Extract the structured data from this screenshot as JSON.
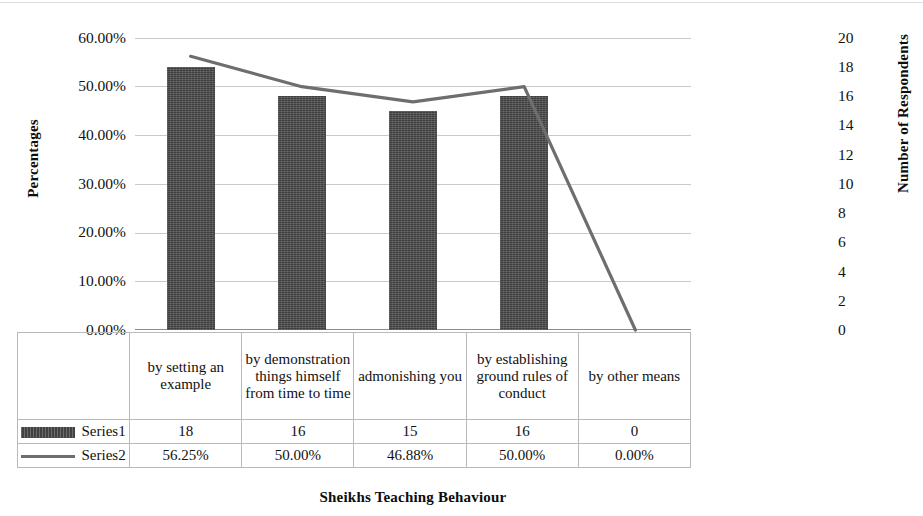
{
  "chart_data": {
    "type": "bar",
    "title": "",
    "xlabel": "Sheikhs Teaching Behaviour",
    "ylabel": "Percentages",
    "y2label": "Number of Respondents",
    "categories": [
      "by setting an example",
      "by demonstration things himself from time to time",
      "admonishing you",
      "by establishing ground rules of conduct",
      "by other means"
    ],
    "series": [
      {
        "name": "Series1",
        "type": "bar",
        "axis": "right",
        "values": [
          18,
          16,
          15,
          16,
          0
        ],
        "display_values": [
          "18",
          "16",
          "15",
          "16",
          "0"
        ],
        "color": "#4b4b4b"
      },
      {
        "name": "Series2",
        "type": "line",
        "axis": "left",
        "values": [
          56.25,
          50.0,
          46.88,
          50.0,
          0.0
        ],
        "display_values": [
          "56.25%",
          "50.00%",
          "46.88%",
          "50.00%",
          "0.00%"
        ],
        "color": "#6e6e6e"
      }
    ],
    "ylim": [
      0,
      60
    ],
    "y2lim": [
      0,
      20
    ],
    "yticks": [
      "0.00%",
      "10.00%",
      "20.00%",
      "30.00%",
      "40.00%",
      "50.00%",
      "60.00%"
    ],
    "ytick_values": [
      0,
      10,
      20,
      30,
      40,
      50,
      60
    ],
    "y2ticks": [
      "0",
      "2",
      "4",
      "6",
      "8",
      "10",
      "12",
      "14",
      "16",
      "18",
      "20"
    ],
    "y2tick_values": [
      0,
      2,
      4,
      6,
      8,
      10,
      12,
      14,
      16,
      18,
      20
    ],
    "grid": true,
    "legend_position": "data-table"
  },
  "axes": {
    "left_title": "Percentages",
    "right_title": "Number of Respondents",
    "bottom_title": "Sheikhs Teaching Behaviour"
  },
  "table": {
    "row_labels": [
      "Series1",
      "Series2"
    ],
    "categories": [
      "by setting an example",
      "by demonstration things himself from time to time",
      "admonishing you",
      "by establishing ground rules of conduct",
      "by other means"
    ],
    "rows": [
      {
        "label": "Series1",
        "marker": "bar-swatch",
        "values": [
          "18",
          "16",
          "15",
          "16",
          "0"
        ]
      },
      {
        "label": "Series2",
        "marker": "line-swatch",
        "values": [
          "56.25%",
          "50.00%",
          "46.88%",
          "50.00%",
          "0.00%"
        ]
      }
    ]
  }
}
